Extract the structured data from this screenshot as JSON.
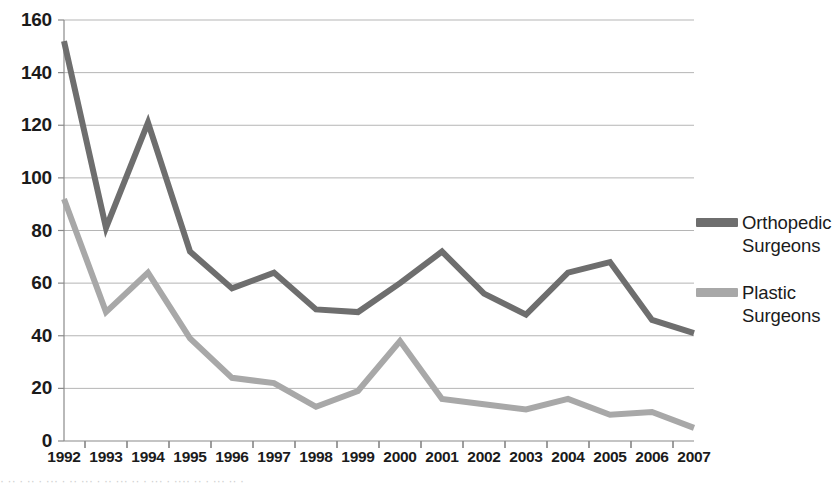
{
  "chart_data": {
    "type": "line",
    "title": "",
    "xlabel": "",
    "ylabel": "",
    "categories": [
      "1992",
      "1993",
      "1994",
      "1995",
      "1996",
      "1997",
      "1998",
      "1999",
      "2000",
      "2001",
      "2002",
      "2003",
      "2004",
      "2005",
      "2006",
      "2007"
    ],
    "xlim": [
      1992,
      2007
    ],
    "ylim": [
      0,
      160
    ],
    "ytick_values": [
      0,
      20,
      40,
      60,
      80,
      100,
      120,
      140,
      160
    ],
    "ytick_labels": [
      "0",
      "20",
      "40",
      "60",
      "80",
      "100",
      "120",
      "140",
      "160"
    ],
    "grid": "horizontal",
    "legend_position": "right",
    "series": [
      {
        "name": "Orthopedic Surgeons",
        "color": "#6e6e6e",
        "values": [
          152,
          81,
          121,
          72,
          58,
          64,
          50,
          49,
          60,
          72,
          56,
          48,
          64,
          68,
          46,
          41
        ]
      },
      {
        "name": "Plastic Surgeons",
        "color": "#a8a8a8",
        "values": [
          92,
          49,
          64,
          39,
          24,
          22,
          13,
          19,
          38,
          16,
          14,
          12,
          16,
          10,
          11,
          5
        ]
      }
    ]
  },
  "legend": {
    "entries": [
      {
        "label_line1": "Orthopedic",
        "label_line2": "Surgeons"
      },
      {
        "label_line1": "Plastic",
        "label_line2": "Surgeons"
      }
    ]
  },
  "caption": {
    "text": "· ·· ·  ··  · ··· · ··  ··· ·  ·· ··· ·· ·  ··· · ····  ·· · ··· ··  ·"
  },
  "axes": {
    "axis_color": "#8a8a8a",
    "grid_color": "#b5b5b5",
    "tick_color": "#1b1b1b"
  }
}
